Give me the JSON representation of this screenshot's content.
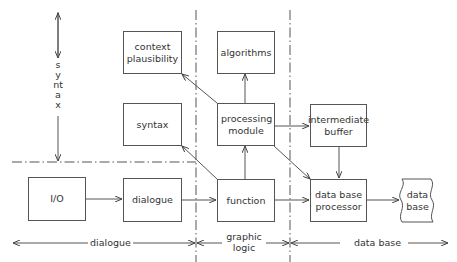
{
  "diagram": {
    "type": "block-diagram",
    "boxes": {
      "context_plausibility": "context plausibility",
      "algorithms": "algorithms",
      "syntax": "syntax",
      "processing_module": "processing module",
      "intermediate_buffer": "intermediate buffer",
      "io": "I/O",
      "dialogue": "dialogue",
      "function": "function",
      "data_base_processor": "data base processor",
      "data_base": "data base"
    },
    "regions": {
      "syntax": "syntax",
      "dialogue": "dialogue",
      "graphic_logic": "graphic logic",
      "data_base": "data base"
    },
    "edges": [
      {
        "from": "I/O",
        "to": "dialogue"
      },
      {
        "from": "dialogue",
        "to": "function"
      },
      {
        "from": "function",
        "to": "processing module"
      },
      {
        "from": "function",
        "to": "syntax"
      },
      {
        "from": "function",
        "to": "data base processor"
      },
      {
        "from": "processing module",
        "to": "algorithms"
      },
      {
        "from": "processing module",
        "to": "context plausibility"
      },
      {
        "from": "processing module",
        "to": "intermediate buffer"
      },
      {
        "from": "processing module",
        "to": "data base processor"
      },
      {
        "from": "intermediate buffer",
        "to": "data base processor"
      },
      {
        "from": "data base processor",
        "to": "data base"
      }
    ]
  }
}
